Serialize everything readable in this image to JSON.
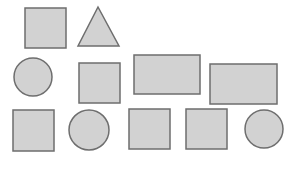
{
  "diagram": {
    "width": 293,
    "height": 170,
    "fill": "#d2d2d2",
    "stroke": "#6e6e6e",
    "stroke_width": 1.5,
    "shapes": [
      {
        "id": "square-1",
        "type": "rect",
        "row": 1,
        "x": 25,
        "y": 8,
        "w": 41,
        "h": 40
      },
      {
        "id": "triangle-1",
        "type": "triangle",
        "row": 1,
        "points": "98,7 78,46 119,46"
      },
      {
        "id": "circle-1",
        "type": "circle",
        "row": 2,
        "cx": 33,
        "cy": 77,
        "r": 19
      },
      {
        "id": "square-2",
        "type": "rect",
        "row": 2,
        "x": 79,
        "y": 63,
        "w": 41,
        "h": 40
      },
      {
        "id": "rectangle-1",
        "type": "rect",
        "row": 2,
        "x": 134,
        "y": 55,
        "w": 66,
        "h": 39
      },
      {
        "id": "rectangle-2",
        "type": "rect",
        "row": 2,
        "x": 210,
        "y": 64,
        "w": 67,
        "h": 40
      },
      {
        "id": "square-3",
        "type": "rect",
        "row": 3,
        "x": 13,
        "y": 110,
        "w": 41,
        "h": 41
      },
      {
        "id": "circle-2",
        "type": "circle",
        "row": 3,
        "cx": 89,
        "cy": 130,
        "r": 20
      },
      {
        "id": "square-4",
        "type": "rect",
        "row": 3,
        "x": 129,
        "y": 109,
        "w": 41,
        "h": 40
      },
      {
        "id": "square-5",
        "type": "rect",
        "row": 3,
        "x": 186,
        "y": 109,
        "w": 41,
        "h": 40
      },
      {
        "id": "circle-3",
        "type": "circle",
        "row": 3,
        "cx": 264,
        "cy": 129,
        "r": 19
      }
    ]
  }
}
